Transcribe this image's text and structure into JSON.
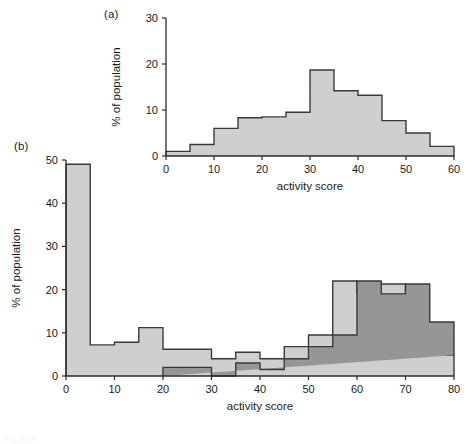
{
  "figure": {
    "caption": "Fig. 2.10",
    "background": "#ffffff"
  },
  "panels": [
    {
      "key": "a",
      "label": "(a)",
      "xlabel": "activity score",
      "ylabel": "% of population"
    },
    {
      "key": "b",
      "label": "(b)",
      "xlabel": "activity score",
      "ylabel": "% of population"
    }
  ],
  "colors": {
    "light_fill": "#cfcfcf",
    "dark_fill": "#969696",
    "outline": "#3a3a3a",
    "axis": "#2b2b2b",
    "text": "#1a1a1a"
  },
  "chart_data": [
    {
      "id": "panel-a",
      "type": "bar",
      "title": "(a)",
      "xlabel": "activity score",
      "ylabel": "% of population",
      "xlim": [
        0,
        60
      ],
      "ylim": [
        0,
        30
      ],
      "xticks": [
        0,
        10,
        20,
        30,
        40,
        50,
        60
      ],
      "yticks": [
        0,
        10,
        20,
        30
      ],
      "bin_width": 5,
      "grid": false,
      "legend": "none",
      "bin_edges": [
        0,
        5,
        10,
        15,
        20,
        25,
        30,
        35,
        40,
        45,
        50,
        55,
        60
      ],
      "series": [
        {
          "name": "population",
          "fill": "#cfcfcf",
          "values": [
            1.0,
            2.5,
            6.0,
            8.3,
            8.5,
            9.5,
            18.7,
            14.2,
            13.2,
            7.7,
            5.0,
            2.1
          ]
        }
      ]
    },
    {
      "id": "panel-b",
      "type": "bar",
      "title": "(b)",
      "xlabel": "activity score",
      "ylabel": "% of population",
      "xlim": [
        0,
        80
      ],
      "ylim": [
        0,
        50
      ],
      "xticks": [
        0,
        10,
        20,
        30,
        40,
        50,
        60,
        70,
        80
      ],
      "yticks": [
        0,
        10,
        20,
        30,
        40,
        50
      ],
      "bin_width": 5,
      "grid": false,
      "legend": "none",
      "bin_edges": [
        0,
        5,
        10,
        15,
        20,
        25,
        30,
        35,
        40,
        45,
        50,
        55,
        60,
        65,
        70,
        75,
        80
      ],
      "series": [
        {
          "name": "light-population",
          "fill": "#cfcfcf",
          "values": [
            49.0,
            7.2,
            7.8,
            11.2,
            6.2,
            6.2,
            4.0,
            5.5,
            4.0,
            6.8,
            9.5,
            22.0,
            19.0,
            21.3,
            12.5,
            4.8
          ]
        },
        {
          "name": "dark-population",
          "fill": "#969696",
          "start_bin": 4,
          "values": [
            2.0,
            2.0,
            0.0,
            3.0,
            1.5,
            4.0,
            6.8,
            9.5,
            22.0,
            19.0,
            21.3,
            12.5,
            4.8
          ]
        }
      ]
    }
  ]
}
